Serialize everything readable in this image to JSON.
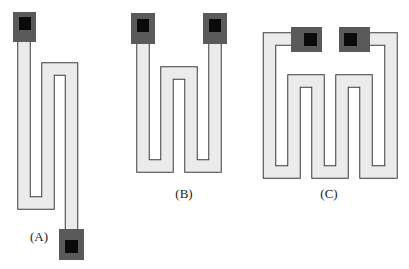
{
  "figure": {
    "colors": {
      "background": "#ffffff",
      "strip_fill": "#ebebeb",
      "strip_outline": "#3a3a3a",
      "pad_outer": "#5a5a5a",
      "pad_inner": "#0a0a0a"
    },
    "panels": [
      {
        "id": "A",
        "label": "(A)",
        "description": "serpentine resistor, pads at opposite ends"
      },
      {
        "id": "B",
        "label": "(B)",
        "description": "serpentine resistor, pads at top"
      },
      {
        "id": "C",
        "label": "(C)",
        "description": "serpentine resistor, pads at top center"
      }
    ]
  }
}
